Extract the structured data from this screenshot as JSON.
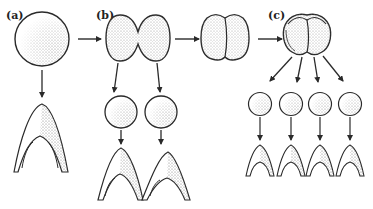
{
  "figure": {
    "panels": [
      {
        "label": "(a)",
        "stage": "single cell egg",
        "result": "one normal larva"
      },
      {
        "label": "(b)",
        "stage": "two-cell stage, blastomeres separated",
        "result": "two normal larvae"
      },
      {
        "label": "(c)",
        "stage": "four-cell stage, blastomeres separated",
        "result": "four small normal larvae"
      }
    ]
  },
  "colors": {
    "stroke": "#2a2a2a",
    "fill": "#ffffff",
    "stipple": "#9a9a9a"
  }
}
